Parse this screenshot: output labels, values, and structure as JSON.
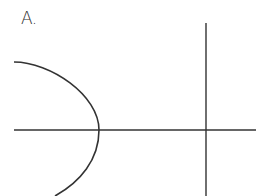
{
  "label": "A.",
  "diagram": {
    "type": "axes-with-curve",
    "horizontal_axis": {
      "x1": 14,
      "x2": 256,
      "y": 130
    },
    "vertical_axis": {
      "x": 206,
      "y1": 23,
      "y2": 196
    },
    "curve": {
      "shape": "left-opening parabola",
      "vertex": [
        99,
        130
      ],
      "top_end": [
        14,
        62
      ],
      "bottom_end": [
        55,
        196
      ]
    },
    "stroke_color": "#333333"
  }
}
